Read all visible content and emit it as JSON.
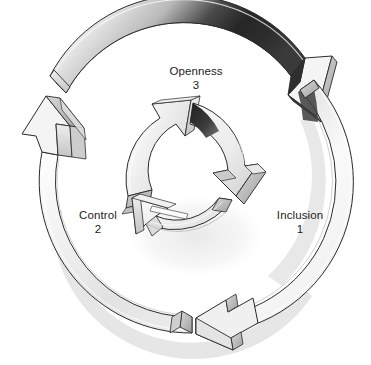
{
  "diagram": {
    "type": "cycle",
    "background_color": "#ffffff",
    "ink_color": "#1c1c1c",
    "band_light": "#f7f7f7",
    "band_mid": "#d6d6d6",
    "band_dark": "#a9a9a9",
    "accent_dark": "#2a2a2a",
    "shadow_color": "#cfcfcf",
    "direction": "counterclockwise",
    "rings": [
      {
        "name": "outer-ring",
        "segments": 2,
        "description": "Two large 3D curved arrow bands forming the outer cycle, dark shaded at top-right"
      },
      {
        "name": "inner-ring",
        "segments": 3,
        "description": "Three small 3D curved arrow segments forming the inner cycle"
      }
    ],
    "labels": [
      {
        "id": "openness",
        "text": "Openness",
        "number": "3",
        "position": "top"
      },
      {
        "id": "inclusion",
        "text": "Inclusion",
        "number": "1",
        "position": "right"
      },
      {
        "id": "control",
        "text": "Control",
        "number": "2",
        "position": "left"
      }
    ]
  }
}
